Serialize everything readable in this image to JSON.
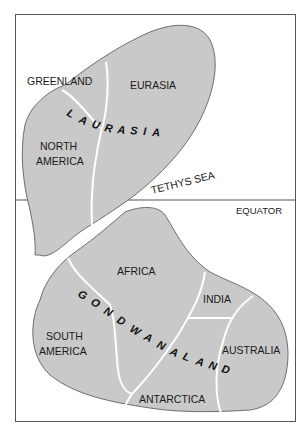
{
  "diagram": {
    "type": "map",
    "colors": {
      "landmass": "#c9c9c9",
      "border": "#6e6e6e",
      "frame": "#555555",
      "background": "#ffffff",
      "text": "#1a1a1a"
    },
    "equator_label": "EQUATOR",
    "sea_label": "TETHYS SEA",
    "supercontinents": [
      {
        "name": "LAURASIA",
        "letters": [
          "L",
          "A",
          "U",
          "R",
          "A",
          "S",
          "I",
          "A"
        ],
        "regions": [
          {
            "label_lines": [
              "GREENLAND"
            ]
          },
          {
            "label_lines": [
              "EURASIA"
            ]
          },
          {
            "label_lines": [
              "NORTH",
              "AMERICA"
            ]
          }
        ]
      },
      {
        "name": "GONDWANALAND",
        "letters": [
          "G",
          "O",
          "N",
          "D",
          "W",
          "A",
          "N",
          "A",
          "L",
          "A",
          "N",
          "D"
        ],
        "regions": [
          {
            "label_lines": [
              "AFRICA"
            ]
          },
          {
            "label_lines": [
              "INDIA"
            ]
          },
          {
            "label_lines": [
              "SOUTH",
              "AMERICA"
            ]
          },
          {
            "label_lines": [
              "AUSTRALIA"
            ]
          },
          {
            "label_lines": [
              "ANTARCTICA"
            ]
          }
        ]
      }
    ]
  }
}
